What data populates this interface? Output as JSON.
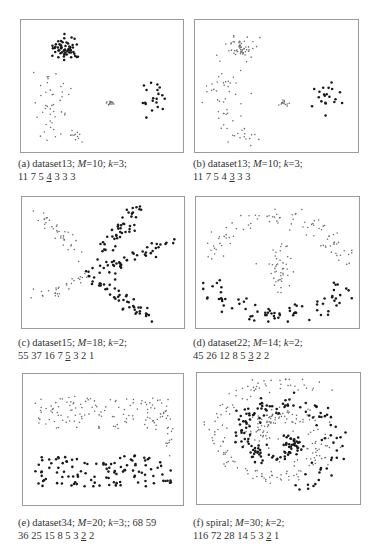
{
  "figure": {
    "panels": [
      {
        "id": "a",
        "frame": {
          "x": 20,
          "y": 19,
          "w": 164,
          "h": 134
        },
        "caption": {
          "x": 18,
          "y": 158,
          "line1_prefix": "(a) dataset13; ",
          "M": "10",
          "k": "3",
          "line1_suffix": "",
          "sizes_before": "11 7 5 ",
          "sizes_underlined": "4",
          "sizes_after": " 3 3 3"
        },
        "dataset": "dataset13",
        "M": 10,
        "k": 3,
        "cluster_sizes": [
          11,
          7,
          5,
          4,
          3,
          3,
          3
        ],
        "selected_index": 3
      },
      {
        "id": "b",
        "frame": {
          "x": 194,
          "y": 19,
          "w": 165,
          "h": 134
        },
        "caption": {
          "x": 193,
          "y": 158,
          "line1_prefix": "(b) dataset13; ",
          "M": "10",
          "k": "3",
          "line1_suffix": "",
          "sizes_before": "11 7 5 4 ",
          "sizes_underlined": "3",
          "sizes_after": " 3 3"
        },
        "dataset": "dataset13",
        "M": 10,
        "k": 3,
        "cluster_sizes": [
          11,
          7,
          5,
          4,
          3,
          3,
          3
        ],
        "selected_index": 4
      },
      {
        "id": "c",
        "frame": {
          "x": 21,
          "y": 196,
          "w": 164,
          "h": 133
        },
        "caption": {
          "x": 18,
          "y": 337,
          "line1_prefix": "(c) dataset15; ",
          "M": "18",
          "k": "2",
          "line1_suffix": "",
          "sizes_before": "55 37 16 7 ",
          "sizes_underlined": "5",
          "sizes_after": " 3 2 1"
        },
        "dataset": "dataset15",
        "M": 18,
        "k": 2,
        "cluster_sizes": [
          55,
          37,
          16,
          7,
          5,
          3,
          2,
          1
        ],
        "selected_index": 4
      },
      {
        "id": "d",
        "frame": {
          "x": 195,
          "y": 196,
          "w": 165,
          "h": 133
        },
        "caption": {
          "x": 193,
          "y": 337,
          "line1_prefix": "(d) dataset22; ",
          "M": "14",
          "k": "2",
          "line1_suffix": "",
          "sizes_before": "45 26 12 8 5 ",
          "sizes_underlined": "3",
          "sizes_after": " 2 2"
        },
        "dataset": "dataset22",
        "M": 14,
        "k": 2,
        "cluster_sizes": [
          45,
          26,
          12,
          8,
          5,
          3,
          2,
          2
        ],
        "selected_index": 5
      },
      {
        "id": "e",
        "frame": {
          "x": 22,
          "y": 373,
          "w": 162,
          "h": 133
        },
        "caption": {
          "x": 18,
          "y": 517,
          "line1_prefix": "(e) dataset34; ",
          "M": "20",
          "k": "3",
          "line1_suffix": "; 68 59",
          "sizes_before": "36 25 15 8 5 3 ",
          "sizes_underlined": "2",
          "sizes_after": " 2"
        },
        "dataset": "dataset34",
        "M": 20,
        "k": 3,
        "cluster_sizes": [
          68,
          59,
          36,
          25,
          15,
          8,
          5,
          3,
          2,
          2
        ],
        "selected_index": 8
      },
      {
        "id": "f",
        "frame": {
          "x": 196,
          "y": 372,
          "w": 165,
          "h": 133
        },
        "caption": {
          "x": 193,
          "y": 517,
          "line1_prefix": "(f) spiral; ",
          "M": "30",
          "k": "2",
          "line1_suffix": "",
          "sizes_before": "116 72 28 14 5 3 ",
          "sizes_underlined": "2",
          "sizes_after": " 1"
        },
        "dataset": "spiral",
        "M": 30,
        "k": 2,
        "cluster_sizes": [
          116,
          72,
          28,
          14,
          5,
          3,
          2,
          1
        ],
        "selected_index": 6
      }
    ],
    "colors": {
      "frame": "#9a9a9a",
      "point_dark": "#1a1a1a",
      "point_light": "#6a6a6a",
      "text": "#333333"
    }
  },
  "chart_data": [
    {
      "type": "scatter",
      "title": "(a) dataset13; M=10; k=3",
      "grid": false,
      "series": [
        {
          "name": "dense cluster (top-left)",
          "style": "dark",
          "shape": "blob",
          "cx": 0.27,
          "cy": 0.2,
          "rx": 0.09,
          "ry": 0.09,
          "n": 55
        },
        {
          "name": "ring cluster (right)",
          "style": "dark",
          "shape": "blob",
          "cx": 0.82,
          "cy": 0.58,
          "rx": 0.1,
          "ry": 0.14,
          "n": 20
        },
        {
          "name": "sparse left points",
          "style": "light",
          "shape": "blob",
          "cx": 0.17,
          "cy": 0.6,
          "rx": 0.12,
          "ry": 0.28,
          "n": 40
        },
        {
          "name": "sparse bottom points",
          "style": "light",
          "shape": "blob",
          "cx": 0.28,
          "cy": 0.9,
          "rx": 0.12,
          "ry": 0.07,
          "n": 15
        },
        {
          "name": "central bridge",
          "style": "light",
          "shape": "blob",
          "cx": 0.55,
          "cy": 0.64,
          "rx": 0.04,
          "ry": 0.02,
          "n": 14
        }
      ]
    },
    {
      "type": "scatter",
      "title": "(b) dataset13; M=10; k=3",
      "grid": false,
      "series": [
        {
          "name": "top-left cluster",
          "style": "light",
          "shape": "blob",
          "cx": 0.27,
          "cy": 0.2,
          "rx": 0.09,
          "ry": 0.09,
          "n": 55
        },
        {
          "name": "ring cluster (right)",
          "style": "dark",
          "shape": "blob",
          "cx": 0.82,
          "cy": 0.58,
          "rx": 0.1,
          "ry": 0.14,
          "n": 20
        },
        {
          "name": "sparse left points",
          "style": "light",
          "shape": "blob",
          "cx": 0.17,
          "cy": 0.6,
          "rx": 0.12,
          "ry": 0.28,
          "n": 40
        },
        {
          "name": "sparse bottom points",
          "style": "light",
          "shape": "blob",
          "cx": 0.28,
          "cy": 0.9,
          "rx": 0.12,
          "ry": 0.07,
          "n": 15
        },
        {
          "name": "central bridge",
          "style": "light",
          "shape": "blob",
          "cx": 0.55,
          "cy": 0.64,
          "rx": 0.04,
          "ry": 0.02,
          "n": 14
        }
      ]
    },
    {
      "type": "scatter",
      "title": "(c) dataset15; M=18; k=2",
      "grid": false,
      "series": [
        {
          "name": "arm up-right",
          "style": "dark",
          "shape": "line",
          "x0": 0.42,
          "y0": 0.6,
          "x1": 0.72,
          "y1": 0.05,
          "spread": 0.03,
          "n": 50
        },
        {
          "name": "arm right",
          "style": "dark",
          "shape": "line",
          "x0": 0.45,
          "y0": 0.58,
          "x1": 0.96,
          "y1": 0.32,
          "spread": 0.025,
          "n": 40
        },
        {
          "name": "arm down-right",
          "style": "dark",
          "shape": "line",
          "x0": 0.45,
          "y0": 0.62,
          "x1": 0.8,
          "y1": 0.96,
          "spread": 0.03,
          "n": 45
        },
        {
          "name": "arm up-left",
          "style": "light",
          "shape": "line",
          "x0": 0.1,
          "y0": 0.1,
          "x1": 0.35,
          "y1": 0.45,
          "spread": 0.03,
          "n": 35
        },
        {
          "name": "arm down-left",
          "style": "light",
          "shape": "line",
          "x0": 0.05,
          "y0": 0.8,
          "x1": 0.38,
          "y1": 0.6,
          "spread": 0.03,
          "n": 30
        }
      ]
    },
    {
      "type": "scatter",
      "title": "(d) dataset22; M=14; k=2",
      "grid": false,
      "series": [
        {
          "name": "upper arc",
          "style": "light",
          "shape": "arc",
          "cx": 0.5,
          "cy": 0.62,
          "rx": 0.46,
          "ry": 0.5,
          "a0": 200,
          "a1": 340,
          "spread": 0.05,
          "n": 90
        },
        {
          "name": "lower arc",
          "style": "dark",
          "shape": "arc",
          "cx": 0.5,
          "cy": 0.55,
          "rx": 0.45,
          "ry": 0.38,
          "a0": 20,
          "a1": 160,
          "spread": 0.05,
          "n": 75
        },
        {
          "name": "inner blob",
          "style": "light",
          "shape": "blob",
          "cx": 0.5,
          "cy": 0.55,
          "rx": 0.1,
          "ry": 0.2,
          "n": 45
        }
      ]
    },
    {
      "type": "scatter",
      "title": "(e) dataset34; M=20; k=3",
      "grid": false,
      "series": [
        {
          "name": "upper band",
          "style": "light",
          "shape": "band",
          "x0": 0.05,
          "x1": 0.95,
          "y0": 0.15,
          "y1": 0.42,
          "n": 130
        },
        {
          "name": "lower band",
          "style": "dark",
          "shape": "band",
          "x0": 0.05,
          "x1": 0.95,
          "y0": 0.63,
          "y1": 0.88,
          "n": 110
        },
        {
          "name": "right connector",
          "style": "light",
          "shape": "band",
          "x0": 0.9,
          "x1": 0.96,
          "y0": 0.4,
          "y1": 0.65,
          "n": 10
        }
      ]
    },
    {
      "type": "scatter",
      "title": "(f) spiral; M=30; k=2",
      "grid": false,
      "series": [
        {
          "name": "outer spiral arm",
          "style": "light",
          "shape": "spiral",
          "cx": 0.5,
          "cy": 0.5,
          "r0": 0.12,
          "r1": 0.48,
          "t0": 0,
          "t1": 8.5,
          "phase": 3.14,
          "spread": 0.04,
          "n": 240
        },
        {
          "name": "inner spiral arm",
          "style": "dark",
          "shape": "spiral",
          "cx": 0.5,
          "cy": 0.5,
          "r0": 0.08,
          "r1": 0.4,
          "t0": 0,
          "t1": 7.5,
          "phase": 0,
          "spread": 0.035,
          "n": 170
        }
      ]
    }
  ]
}
